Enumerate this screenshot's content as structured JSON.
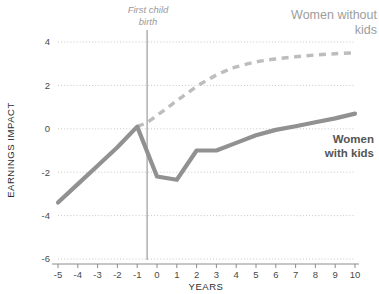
{
  "chart_data": {
    "type": "line",
    "title": "",
    "xlabel": "YEARS",
    "ylabel": "EARNINGS IMPACT",
    "xlim": [
      -5,
      10
    ],
    "ylim": [
      -6,
      4
    ],
    "grid": true,
    "legend_position": "inline-annotations",
    "xticks": [
      "-5",
      "-4",
      "-3",
      "-2",
      "-1",
      "0",
      "1",
      "2",
      "3",
      "4",
      "5",
      "6",
      "7",
      "8",
      "9",
      "10"
    ],
    "yticks": [
      "4",
      "2",
      "0",
      "-2",
      "-4",
      "-6"
    ],
    "annotations": [
      {
        "name": "first-child-birth",
        "text_line1": "First child",
        "text_line2": "birth",
        "x_value": -0.5,
        "style": "italic-gray-vertical-rule"
      }
    ],
    "series": [
      {
        "name": "Women without kids",
        "style": "dashed",
        "color": "#bdbdbd",
        "label_line1": "Women without",
        "label_line2": "kids",
        "x": [
          -1,
          -0.5,
          0,
          0.5,
          1,
          1.5,
          2,
          2.5,
          3,
          3.5,
          4,
          5,
          6,
          7,
          8,
          9,
          10
        ],
        "values": [
          0.1,
          0.3,
          0.62,
          0.95,
          1.3,
          1.62,
          1.95,
          2.22,
          2.48,
          2.68,
          2.85,
          3.08,
          3.22,
          3.32,
          3.4,
          3.46,
          3.5
        ]
      },
      {
        "name": "Women with kids",
        "style": "solid",
        "color": "#919191",
        "label_line1": "Women",
        "label_line2": "with kids",
        "x": [
          -5,
          -4,
          -3,
          -2,
          -1,
          0,
          1,
          2,
          3,
          4,
          5,
          6,
          7,
          8,
          9,
          10
        ],
        "values": [
          -3.4,
          -2.55,
          -1.7,
          -0.85,
          0.1,
          -2.2,
          -2.35,
          -1.0,
          -1.0,
          -0.65,
          -0.3,
          -0.05,
          0.12,
          0.3,
          0.48,
          0.7
        ]
      }
    ]
  }
}
